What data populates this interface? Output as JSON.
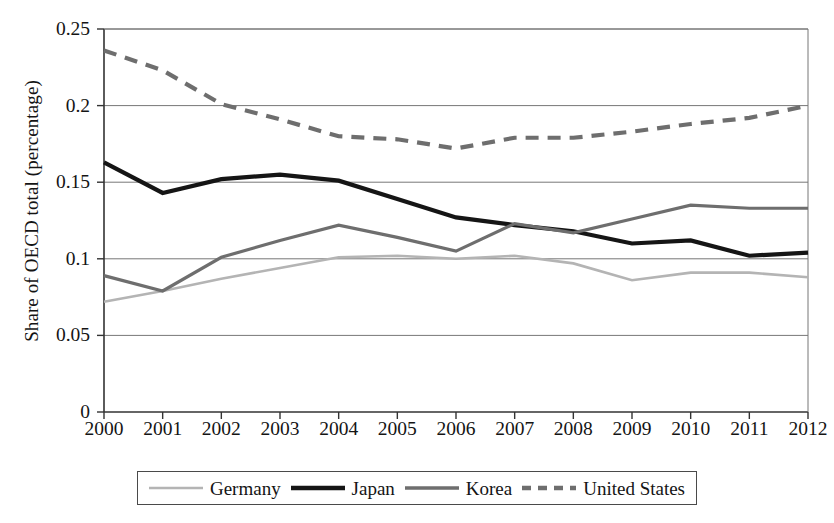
{
  "chart_data": {
    "type": "line",
    "title": "",
    "subtitle": "",
    "xlabel": "",
    "ylabel": "Share of OECD total (percentage)",
    "x": [
      2000,
      2001,
      2002,
      2003,
      2004,
      2005,
      2006,
      2007,
      2008,
      2009,
      2010,
      2011,
      2012
    ],
    "categories": [
      "2000",
      "2001",
      "2002",
      "2003",
      "2004",
      "2005",
      "2006",
      "2007",
      "2008",
      "2009",
      "2010",
      "2011",
      "2012"
    ],
    "xlim": [
      2000,
      2012
    ],
    "ylim": [
      0,
      0.25
    ],
    "y_ticks": [
      0,
      0.05,
      0.1,
      0.15,
      0.2,
      0.25
    ],
    "y_tick_labels": [
      "0",
      "0.05",
      "0.1",
      "0.15",
      "0.2",
      "0.25"
    ],
    "grid": "horizontal",
    "legend_position": "bottom",
    "series": [
      {
        "name": "Germany",
        "color": "#b4b4b4",
        "style": "solid",
        "width": 2.6,
        "values": [
          0.072,
          0.079,
          0.087,
          0.094,
          0.101,
          0.102,
          0.1,
          0.102,
          0.097,
          0.086,
          0.091,
          0.091,
          0.088
        ]
      },
      {
        "name": "Japan",
        "color": "#151515",
        "style": "solid",
        "width": 4.2,
        "values": [
          0.163,
          0.143,
          0.152,
          0.155,
          0.151,
          0.139,
          0.127,
          0.122,
          0.118,
          0.11,
          0.112,
          0.102,
          0.104
        ]
      },
      {
        "name": "Korea",
        "color": "#6e6e6e",
        "style": "solid",
        "width": 3.2,
        "values": [
          0.089,
          0.079,
          0.101,
          0.112,
          0.122,
          0.114,
          0.105,
          0.123,
          0.117,
          0.126,
          0.135,
          0.133,
          0.133
        ]
      },
      {
        "name": "United States",
        "color": "#6e6e6e",
        "style": "dashed",
        "width": 4.2,
        "values": [
          0.236,
          0.223,
          0.201,
          0.191,
          0.18,
          0.178,
          0.172,
          0.179,
          0.179,
          0.183,
          0.188,
          0.192,
          0.2
        ]
      }
    ]
  },
  "axis": {
    "y_title": "Share of OECD total (percentage)",
    "y_labels": [
      "0.25",
      "0.2",
      "0.15",
      "0.1",
      "0.05",
      "0"
    ],
    "x_labels": [
      "2000",
      "2001",
      "2002",
      "2003",
      "2004",
      "2005",
      "2006",
      "2007",
      "2008",
      "2009",
      "2010",
      "2011",
      "2012"
    ]
  },
  "legend": {
    "items": [
      {
        "label": "Germany",
        "color": "#b4b4b4",
        "style": "solid",
        "width": 2.6
      },
      {
        "label": "Japan",
        "color": "#151515",
        "style": "solid",
        "width": 4.6
      },
      {
        "label": "Korea",
        "color": "#6e6e6e",
        "style": "solid",
        "width": 3.4
      },
      {
        "label": "United States",
        "color": "#6e6e6e",
        "style": "dashed",
        "width": 4.6
      }
    ]
  },
  "colors": {
    "germany": "#b4b4b4",
    "japan": "#151515",
    "korea": "#6e6e6e",
    "united_states": "#6e6e6e",
    "axis": "#333333",
    "grid": "#777777",
    "background": "#ffffff"
  }
}
